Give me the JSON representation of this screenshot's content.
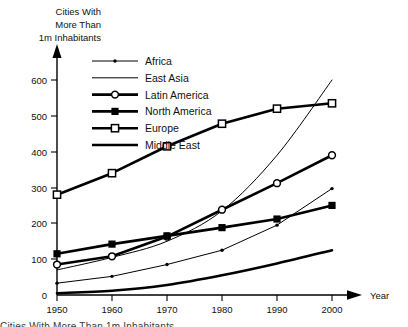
{
  "chart_data": {
    "type": "line",
    "title": "Cities With More Than 1m Inhabitants",
    "title_lines": [
      "Cities With",
      "More Than",
      "1m Inhabitants"
    ],
    "xlabel": "Year",
    "ylabel": "",
    "x": [
      1950,
      1960,
      1970,
      1980,
      1990,
      2000
    ],
    "xticklabels": [
      "1950",
      "1960",
      "1970",
      "1980",
      "1990",
      "2000"
    ],
    "yticks": [
      0,
      100,
      200,
      300,
      400,
      500,
      600
    ],
    "yticklabels": [
      "0",
      "100",
      "200",
      "300",
      "400",
      "500",
      "600"
    ],
    "xlim": [
      1950,
      2000
    ],
    "ylim": [
      0,
      600
    ],
    "grid": false,
    "legend_position": "upper-left-inside",
    "series": [
      {
        "name": "Africa",
        "values": [
          33,
          52,
          85,
          125,
          195,
          297
        ],
        "marker": "small-dot",
        "line": "thin",
        "color": "#000000"
      },
      {
        "name": "East Asia",
        "values": [
          70,
          105,
          150,
          235,
          390,
          600
        ],
        "marker": "none",
        "line": "thin",
        "color": "#000000"
      },
      {
        "name": "Latin America",
        "values": [
          85,
          108,
          163,
          238,
          312,
          390
        ],
        "marker": "open-circle",
        "line": "thick",
        "color": "#000000"
      },
      {
        "name": "North America",
        "values": [
          115,
          142,
          165,
          188,
          212,
          250
        ],
        "marker": "filled-square",
        "line": "thick",
        "color": "#000000"
      },
      {
        "name": "Europe",
        "values": [
          280,
          340,
          415,
          478,
          520,
          535
        ],
        "marker": "open-square",
        "line": "thick",
        "color": "#000000"
      },
      {
        "name": "Middle East",
        "values": [
          5,
          12,
          28,
          55,
          88,
          125
        ],
        "marker": "none",
        "line": "thick",
        "color": "#000000"
      }
    ]
  },
  "caption": {
    "text": "Cities With More Than 1m Inhabitants"
  }
}
